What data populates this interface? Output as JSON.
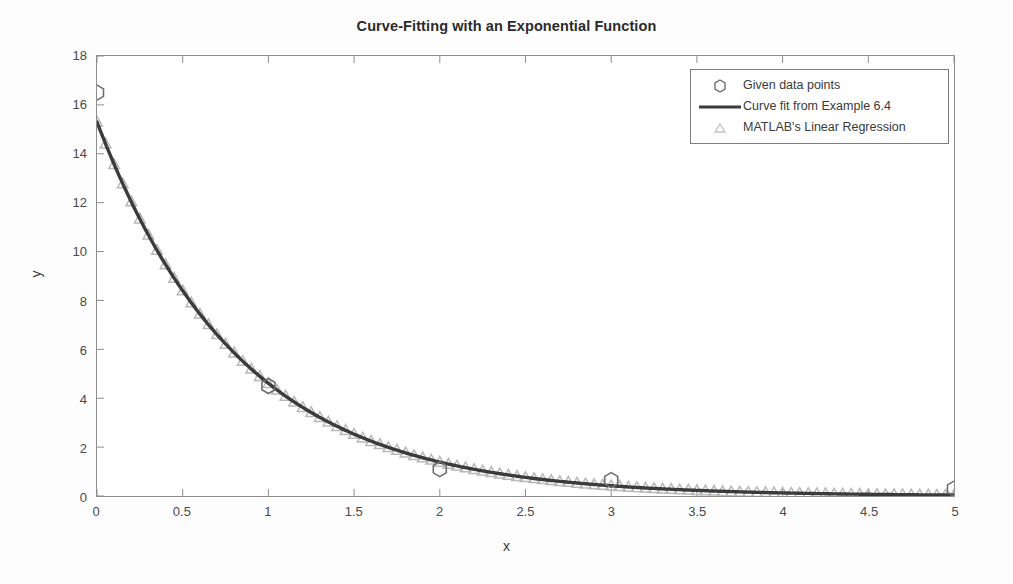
{
  "chart_data": {
    "type": "line",
    "title": "Curve-Fitting with an Exponential Function",
    "xlabel": "x",
    "ylabel": "y",
    "xlim": [
      0,
      5
    ],
    "ylim": [
      0,
      18
    ],
    "xticks": [
      "0",
      "0.5",
      "1",
      "1.5",
      "2",
      "2.5",
      "3",
      "3.5",
      "4",
      "4.5",
      "5"
    ],
    "xtick_values": [
      0,
      0.5,
      1,
      1.5,
      2,
      2.5,
      3,
      3.5,
      4,
      4.5,
      5
    ],
    "yticks": [
      "0",
      "2",
      "4",
      "6",
      "8",
      "10",
      "12",
      "14",
      "16",
      "18"
    ],
    "ytick_values": [
      0,
      2,
      4,
      6,
      8,
      10,
      12,
      14,
      16,
      18
    ],
    "grid": false,
    "legend_position": "upper right",
    "colors": {
      "curve": "#3b3b3b",
      "given_points": "#6e6e6e",
      "regression": "#b9b9b9",
      "axis": "#8d8d8d",
      "text": "#3a3a3a"
    },
    "series": [
      {
        "name": "Given data points",
        "marker": "hexagon",
        "style": "markers",
        "x": [
          0,
          1,
          2,
          3,
          5
        ],
        "y": [
          16.5,
          4.5,
          1.1,
          0.65,
          0.3
        ]
      },
      {
        "name": "Curve fit from Example 6.4",
        "marker": "none",
        "style": "line",
        "equation": "y = 15.3 * exp(-1.2 * x)",
        "x": [
          0,
          0.25,
          0.5,
          0.75,
          1,
          1.25,
          1.5,
          1.75,
          2,
          2.25,
          2.5,
          2.75,
          3,
          3.25,
          3.5,
          3.75,
          4,
          4.25,
          4.5,
          4.75,
          5
        ],
        "y": [
          15.3,
          11.34,
          8.4,
          6.22,
          4.61,
          3.42,
          2.53,
          1.88,
          1.39,
          1.03,
          0.76,
          0.57,
          0.42,
          0.31,
          0.23,
          0.17,
          0.13,
          0.09,
          0.07,
          0.05,
          0.04
        ]
      },
      {
        "name": "MATLAB's Linear Regression",
        "marker": "triangle",
        "style": "markers",
        "note": "dense markers sampled every 0.05 along the fitted curve",
        "x": [
          0,
          0.05,
          0.1,
          0.15,
          0.2,
          0.25,
          0.3,
          0.35,
          0.4,
          0.45,
          0.5,
          0.55,
          0.6,
          0.65,
          0.7,
          0.75,
          0.8,
          0.85,
          0.9,
          0.95,
          1,
          1.05,
          1.1,
          1.15,
          1.2,
          1.25,
          1.3,
          1.35,
          1.4,
          1.45,
          1.5,
          1.55,
          1.6,
          1.65,
          1.7,
          1.75,
          1.8,
          1.85,
          1.9,
          1.95,
          2,
          2.05,
          2.1,
          2.15,
          2.2,
          2.25,
          2.3,
          2.35,
          2.4,
          2.45,
          2.5,
          2.55,
          2.6,
          2.65,
          2.7,
          2.75,
          2.8,
          2.85,
          2.9,
          2.95,
          3,
          3.05,
          3.1,
          3.15,
          3.2,
          3.25,
          3.3,
          3.35,
          3.4,
          3.45,
          3.5,
          3.55,
          3.6,
          3.65,
          3.7,
          3.75,
          3.8,
          3.85,
          3.9,
          3.95,
          4,
          4.05,
          4.1,
          4.15,
          4.2,
          4.25,
          4.3,
          4.35,
          4.4,
          4.45,
          4.5,
          4.55,
          4.6,
          4.65,
          4.7,
          4.75,
          4.8,
          4.85,
          4.9,
          4.95,
          5
        ],
        "y": [
          15.3,
          14.41,
          13.57,
          12.78,
          12.04,
          11.34,
          10.68,
          10.06,
          9.47,
          8.92,
          8.4,
          7.91,
          7.45,
          7.02,
          6.61,
          6.22,
          5.86,
          5.52,
          5.2,
          4.9,
          4.61,
          4.34,
          4.09,
          3.85,
          3.63,
          3.42,
          3.22,
          3.03,
          2.85,
          2.69,
          2.53,
          2.38,
          2.24,
          2.11,
          1.99,
          1.88,
          1.77,
          1.66,
          1.57,
          1.48,
          1.39,
          1.31,
          1.23,
          1.16,
          1.09,
          1.03,
          0.97,
          0.91,
          0.86,
          0.81,
          0.76,
          0.72,
          0.68,
          0.64,
          0.6,
          0.57,
          0.53,
          0.5,
          0.47,
          0.45,
          0.42,
          0.4,
          0.37,
          0.35,
          0.33,
          0.31,
          0.29,
          0.28,
          0.26,
          0.25,
          0.23,
          0.22,
          0.21,
          0.19,
          0.18,
          0.17,
          0.16,
          0.15,
          0.15,
          0.14,
          0.13,
          0.12,
          0.12,
          0.11,
          0.1,
          0.1,
          0.09,
          0.09,
          0.08,
          0.08,
          0.07,
          0.07,
          0.06,
          0.06,
          0.06,
          0.05,
          0.05,
          0.05,
          0.04,
          0.04,
          0.04
        ]
      }
    ]
  },
  "legend": {
    "items": [
      {
        "label": "Given data points",
        "marker": "hexagon"
      },
      {
        "label": "Curve fit from Example 6.4",
        "marker": "line"
      },
      {
        "label": "MATLAB's Linear Regression",
        "marker": "triangle"
      }
    ]
  }
}
